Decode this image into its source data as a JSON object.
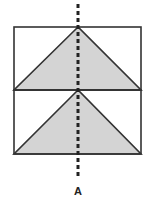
{
  "diagram": {
    "type": "symmetry-figure",
    "colors": {
      "stroke": "#333333",
      "fill": "#d4d4d4",
      "background": "#ffffff",
      "axis": "#222222"
    },
    "axis_label": "A",
    "shapes": [
      {
        "kind": "rectangle",
        "x": 14,
        "y": 27,
        "width": 127,
        "height": 63
      },
      {
        "kind": "rectangle",
        "x": 14,
        "y": 90,
        "width": 127,
        "height": 64
      },
      {
        "kind": "triangle",
        "points": [
          [
            78,
            27
          ],
          [
            14,
            90
          ],
          [
            141,
            90
          ]
        ]
      },
      {
        "kind": "triangle",
        "points": [
          [
            78,
            90
          ],
          [
            14,
            154
          ],
          [
            141,
            154
          ]
        ]
      }
    ],
    "symmetry_line": {
      "x": 78,
      "y1": 4,
      "y2": 178,
      "style": "dashed"
    }
  }
}
